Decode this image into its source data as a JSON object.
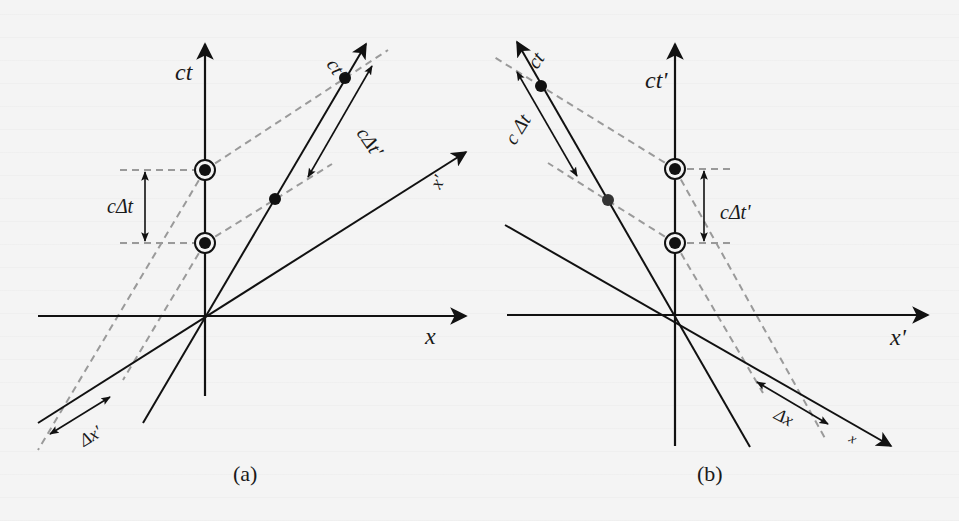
{
  "figure": {
    "panels": [
      {
        "id": "a",
        "caption": "(a)",
        "labels": {
          "ct_axis": "ct",
          "x_axis": "x",
          "ct_prime_axis": "ct'",
          "x_prime_axis": "x'",
          "c_delta_t": "cΔt",
          "c_delta_t_prime": "cΔt'",
          "delta_x_prime": "Δx'"
        }
      },
      {
        "id": "b",
        "caption": "(b)",
        "labels": {
          "ct_prime_axis": "ct'",
          "x_prime_axis": "x'",
          "ct_axis": "ct",
          "x_axis": "x",
          "c_delta_t": "c Δt",
          "c_delta_t_prime": "cΔt'",
          "delta_x": "Δx"
        }
      }
    ]
  },
  "colors": {
    "axis": "#111111",
    "dashed": "#9a9a9a",
    "background": "#f4f4f4"
  }
}
